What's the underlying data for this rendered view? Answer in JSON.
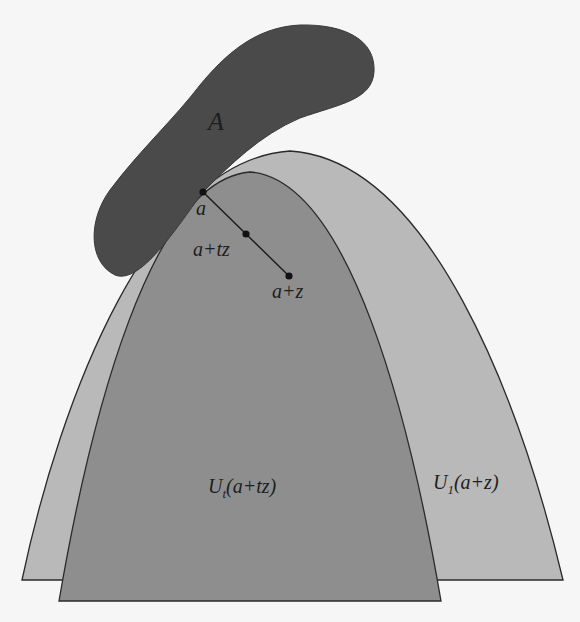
{
  "figure": {
    "colors": {
      "background": "#f6f6f6",
      "set_A": "#4a4a4a",
      "region_outer": "#b9b9b9",
      "region_inner": "#8e8e8e",
      "outline": "#2a2a2a",
      "point": "#111111"
    },
    "labels": {
      "set": "A",
      "point_a": "a",
      "point_atz": "a+tz",
      "point_az": "a+z",
      "region_inner": "U",
      "region_inner_sub": "t",
      "region_inner_arg": "(a+tz)",
      "region_outer": "U",
      "region_outer_sub": "1",
      "region_outer_arg": "(a+z)"
    },
    "points": [
      {
        "name": "a",
        "x": 203,
        "y": 192
      },
      {
        "name": "a+tz",
        "x": 246,
        "y": 234
      },
      {
        "name": "a+z",
        "x": 289,
        "y": 276
      }
    ]
  }
}
